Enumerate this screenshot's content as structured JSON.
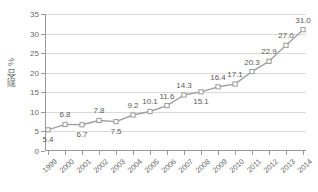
{
  "chart_data": {
    "type": "line",
    "title": "",
    "subtitle": "",
    "xlabel": "",
    "ylabel": "割合 %",
    "categories": [
      "1999",
      "2000",
      "2001",
      "2002",
      "2003",
      "2004",
      "2005",
      "2006",
      "2007",
      "2008",
      "2009",
      "2010",
      "2011",
      "2012",
      "2013",
      "2014"
    ],
    "values": [
      5.4,
      6.8,
      6.7,
      7.8,
      7.5,
      9.2,
      10.1,
      11.6,
      14.3,
      15.1,
      16.4,
      17.1,
      20.3,
      22.9,
      27.0,
      31.0
    ],
    "data_labels": [
      "5.4",
      "6.8",
      "6.7",
      "7.8",
      "7.5",
      "9.2",
      "10.1",
      "11.6",
      "14.3",
      "15.1",
      "16.4",
      "17.1",
      "20.3",
      "22.9",
      "27.0",
      "31.0"
    ],
    "label_positions": [
      "below",
      "above",
      "below",
      "above",
      "below",
      "above",
      "above",
      "above",
      "above",
      "below",
      "above",
      "above",
      "above",
      "above",
      "above",
      "above"
    ],
    "ylim": [
      0,
      35
    ],
    "yticks": [
      0,
      5,
      10,
      15,
      20,
      25,
      30,
      35
    ],
    "ytick_labels": [
      "0",
      "5",
      "10",
      "15",
      "20",
      "25",
      "30",
      "35"
    ],
    "grid": true,
    "grid_axis": "y",
    "legend": false,
    "legend_position": "none",
    "marker": "open-square",
    "series": [
      {
        "name": "割合",
        "values": [
          5.4,
          6.8,
          6.7,
          7.8,
          7.5,
          9.2,
          10.1,
          11.6,
          14.3,
          15.1,
          16.4,
          17.1,
          20.3,
          22.9,
          27.0,
          31.0
        ]
      }
    ],
    "colors": {
      "line": "#a0a0a0",
      "marker_fill": "#ffffff",
      "marker_stroke": "#9a9a9a",
      "grid": "#dadada",
      "axis": "#9a9a9a",
      "text": "#6b6b6b",
      "data_label_text": "#5a5a5a",
      "background": "#ffffff"
    }
  }
}
